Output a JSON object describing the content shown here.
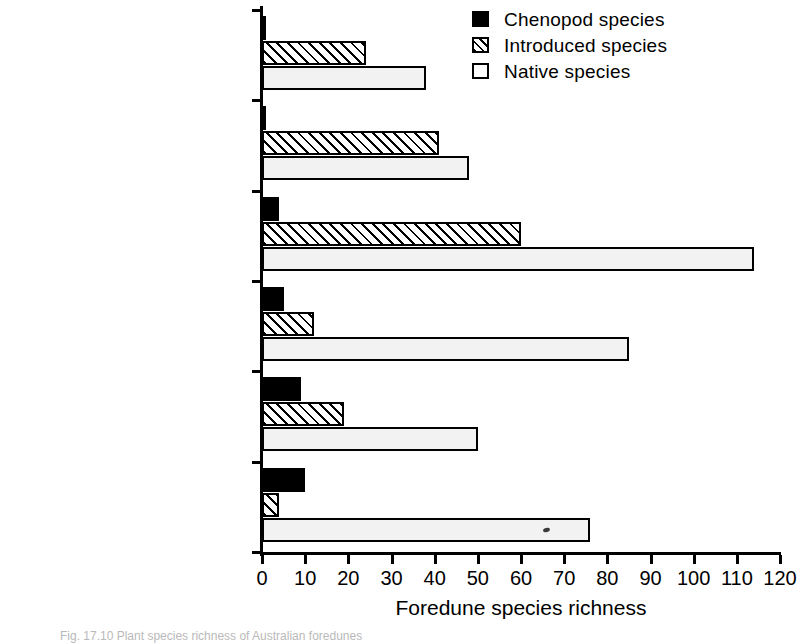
{
  "chart_data": {
    "type": "bar",
    "orientation": "horizontal",
    "title": "",
    "xlabel": "Foredune species richness",
    "ylabel": "",
    "xlim": [
      0,
      120
    ],
    "xticks": [
      0,
      10,
      20,
      30,
      40,
      50,
      60,
      70,
      80,
      90,
      100,
      110,
      120
    ],
    "grid": false,
    "legend_position": "top-right",
    "categories": [
      "Coral Cays",
      "Tropical humid",
      "Temperate humid (SE)",
      "Temperate humid (SW)",
      "Temperate arid",
      "Tropical arid"
    ],
    "series": [
      {
        "name": "Chenopod species",
        "style": "solid-black",
        "color": "#000000",
        "values": [
          1,
          1,
          4,
          5,
          9,
          10
        ]
      },
      {
        "name": "Introduced species",
        "style": "diagonal-hatch",
        "color": "#ffffff",
        "values": [
          24,
          41,
          60,
          12,
          19,
          4
        ]
      },
      {
        "name": "Native species",
        "style": "light-stipple",
        "color": "#f2f2f2",
        "values": [
          38,
          48,
          114,
          85,
          50,
          76
        ]
      }
    ]
  },
  "legend": {
    "items": [
      {
        "label": "Chenopod species",
        "swatch": "solid"
      },
      {
        "label": "Introduced species",
        "swatch": "hatch"
      },
      {
        "label": "Native species",
        "swatch": "open"
      }
    ]
  },
  "axis": {
    "x_title": "Foredune species richness",
    "tick_labels": [
      "0",
      "10",
      "20",
      "30",
      "40",
      "50",
      "60",
      "70",
      "80",
      "90",
      "100",
      "110",
      "120"
    ]
  },
  "caption": {
    "text": "Fig. 17.10  Plant species richness of Australian foredunes"
  }
}
